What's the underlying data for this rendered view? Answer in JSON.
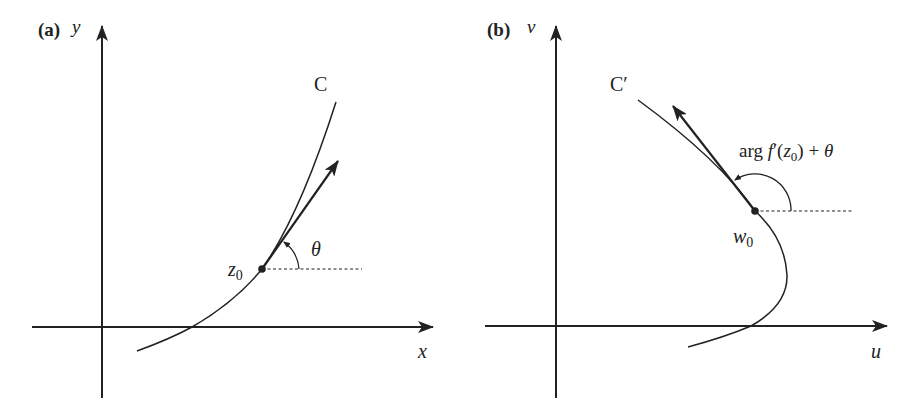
{
  "figure": {
    "panel_a": {
      "tag": "(a)",
      "y_axis_label": "y",
      "x_axis_label": "x",
      "curve_label": "C",
      "point_label": "z",
      "point_subscript": "0",
      "angle_label": "θ"
    },
    "panel_b": {
      "tag": "(b)",
      "y_axis_label": "v",
      "x_axis_label": "u",
      "curve_label": "C′",
      "point_label": "w",
      "point_subscript": "0",
      "angle_label_parts": {
        "arg": "arg",
        "f": "f",
        "prime_open": "′(",
        "z": "z",
        "sub": "0",
        "close": ")",
        "plus": " + ",
        "theta": "θ"
      }
    },
    "colors": {
      "ink": "#222222",
      "background": "#ffffff"
    }
  }
}
